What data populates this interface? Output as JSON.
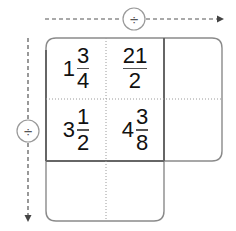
{
  "worksheet": {
    "horizontal_operation": {
      "symbol": "÷",
      "icon": "divide-icon",
      "direction": "right"
    },
    "vertical_operation": {
      "symbol": "÷",
      "icon": "divide-icon",
      "direction": "down"
    },
    "grid": {
      "rows": [
        {
          "cells": [
            {
              "type": "mixed",
              "whole": "1",
              "numerator": "3",
              "denominator": "4"
            },
            {
              "type": "fraction",
              "numerator": "21",
              "denominator": "2"
            },
            {
              "type": "answer",
              "value": ""
            }
          ]
        },
        {
          "cells": [
            {
              "type": "mixed",
              "whole": "3",
              "numerator": "1",
              "denominator": "2"
            },
            {
              "type": "mixed",
              "whole": "4",
              "numerator": "3",
              "denominator": "8"
            },
            {
              "type": "answer",
              "value": ""
            }
          ]
        },
        {
          "cells": [
            {
              "type": "answer",
              "value": ""
            },
            {
              "type": "answer",
              "value": ""
            }
          ]
        }
      ]
    },
    "colors": {
      "outer_border": "#8a8a8a",
      "inner_border": "#666666",
      "dotted_line": "#9a9a9a",
      "arrow": "#555555",
      "text": "#111111"
    }
  }
}
